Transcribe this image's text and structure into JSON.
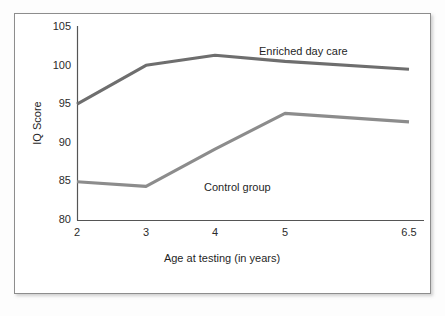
{
  "chart_data": {
    "type": "line",
    "title": "",
    "xlabel": "Age at testing (in years)",
    "ylabel": "IQ Score",
    "categories": [
      "2",
      "3",
      "4",
      "5",
      "6.5"
    ],
    "x_tick_labels": [
      "2",
      "3",
      "4",
      "5",
      "6.5"
    ],
    "y_tick_labels": [
      "80",
      "85",
      "90",
      "95",
      "100",
      "105"
    ],
    "y_ticks": [
      80,
      85,
      90,
      95,
      100,
      105
    ],
    "ylim": [
      80,
      105
    ],
    "grid": false,
    "legend_position": "inline-annotation",
    "series": [
      {
        "name": "Enriched day care",
        "color": "#6e6e6e",
        "values": [
          95.0,
          100.0,
          101.3,
          100.5,
          99.5
        ]
      },
      {
        "name": "Control group",
        "color": "#8c8c8c",
        "values": [
          85.0,
          84.4,
          89.2,
          93.8,
          92.7
        ]
      }
    ],
    "annotations": [
      {
        "text": "Enriched day care",
        "series": "Enriched day care"
      },
      {
        "text": "Control group",
        "series": "Control group"
      }
    ]
  },
  "axes": {
    "y_title": "IQ Score",
    "x_title": "Age at testing (in years)",
    "y_tick_0": "80",
    "y_tick_1": "85",
    "y_tick_2": "90",
    "y_tick_3": "95",
    "y_tick_4": "100",
    "y_tick_5": "105",
    "x_tick_0": "2",
    "x_tick_1": "3",
    "x_tick_2": "4",
    "x_tick_3": "5",
    "x_tick_4": "6.5"
  },
  "labels": {
    "enriched": "Enriched day care",
    "control": "Control group"
  },
  "colors": {
    "enriched_line": "#6e6e6e",
    "control_line": "#8c8c8c",
    "axis": "#555555",
    "frame": "#8d8d8d",
    "text": "#1f1f1f"
  }
}
